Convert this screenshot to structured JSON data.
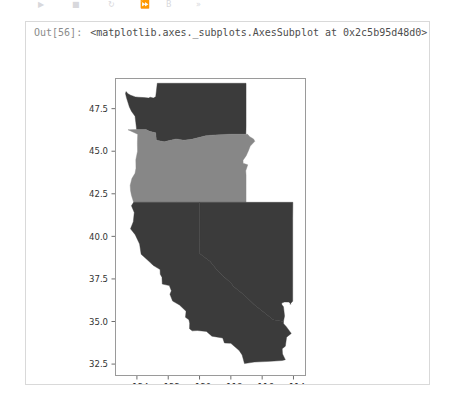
{
  "toolbar": {
    "items": [
      {
        "name": "run-icon",
        "glyph": "▶"
      },
      {
        "name": "stop-icon",
        "glyph": "■"
      },
      {
        "name": "restart-icon",
        "glyph": "↻"
      },
      {
        "name": "fastforward-icon",
        "glyph": "⏩"
      },
      {
        "name": "save-icon",
        "glyph": "὚B"
      },
      {
        "name": "more-icon",
        "glyph": "»"
      }
    ]
  },
  "output": {
    "prompt": "Out[56]:",
    "repr": "<matplotlib.axes._subplots.AxesSubplot at 0x2c5b95d48d0>"
  },
  "chart_data": {
    "type": "map",
    "title": "",
    "xlabel": "",
    "ylabel": "",
    "xlim": [
      -125.4,
      -113.2
    ],
    "ylim": [
      31.8,
      49.3
    ],
    "grid": false,
    "legend": null,
    "xticks": [
      -124,
      -122,
      -120,
      -118,
      -116,
      -114
    ],
    "xticklabels": [
      "−124",
      "−122",
      "−120",
      "−118",
      "−116",
      "−114"
    ],
    "yticks": [
      32.5,
      35.0,
      37.5,
      40.0,
      42.5,
      45.0,
      47.5
    ],
    "yticklabels": [
      "32.5",
      "35.0",
      "37.5",
      "40.0",
      "42.5",
      "45.0",
      "47.5"
    ],
    "colors": {
      "dark": "#3b3b3b",
      "mid": "#878787",
      "background": "#ffffff",
      "spine": "#9a9a9a"
    },
    "regions": [
      {
        "name": "Washington",
        "value": 1,
        "color": "#3b3b3b",
        "polygon": "-124.73,48.39 -124.69,48.50 -124.57,48.37 -124.40,48.29 -124.10,48.19 -123.90,48.17 -123.55,48.15 -123.25,48.12 -123.15,48.17 -122.95,48.12 -122.80,48.20 -122.76,48.50 -122.70,48.99 -117.03,48.99 -117.03,46.43 -117.04,46.00 -118.00,46.00 -119.00,45.96 -119.60,45.91 -120.50,45.70 -121.00,45.65 -121.50,45.72 -122.00,45.61 -122.25,45.55 -122.76,45.65 -122.80,46.08 -123.20,46.17 -123.42,46.27 -124.02,46.28 -124.07,46.68 -124.12,47.05 -124.35,47.35 -124.48,47.60 -124.67,48.15"
      },
      {
        "name": "Oregon",
        "value": 2,
        "color": "#878787",
        "polygon": "-124.57,46.26 -124.02,46.28 -123.42,46.27 -123.20,46.17 -122.80,46.08 -122.76,45.65 -122.25,45.55 -122.00,45.61 -121.50,45.72 -121.00,45.65 -120.50,45.70 -119.60,45.91 -119.00,45.96 -118.00,46.00 -117.04,46.00 -116.93,45.99 -116.79,45.85 -116.55,45.72 -116.47,45.58 -116.76,45.30 -116.89,45.00 -117.02,44.74 -117.22,44.47 -117.22,44.30 -116.92,44.20 -117.05,43.85 -117.03,43.60 -117.03,42.00 -120.00,42.00 -121.45,42.00 -122.50,42.00 -124.21,42.00 -124.35,42.42 -124.41,42.70 -124.43,43.00 -124.32,43.40 -124.12,43.70 -124.06,44.00 -124.07,44.50 -123.96,45.00 -123.97,45.50 -123.95,46.00"
      },
      {
        "name": "California",
        "value": 1,
        "color": "#3b3b3b",
        "polygon": "-124.21,42.00 -122.50,42.00 -121.45,42.00 -120.00,42.00 -120.00,41.00 -120.00,39.80 -119.99,39.00 -119.60,38.71 -119.32,38.53 -118.95,38.10 -118.43,37.62 -118.00,37.28 -117.83,37.06 -117.17,36.57 -116.52,36.00 -115.85,35.52 -115.30,35.10 -114.64,35.00 -114.63,34.87 -114.47,34.71 -114.14,34.30 -114.44,34.08 -114.52,33.55 -114.72,33.40 -114.70,33.09 -114.52,32.76 -114.72,32.71 -115.50,32.66 -116.50,32.62 -117.13,32.53 -117.28,33.04 -117.47,33.30 -118.00,33.72 -118.41,33.74 -118.52,34.03 -119.21,34.14 -119.56,34.42 -120.14,34.47 -120.47,34.45 -120.64,34.58 -120.63,34.90 -120.68,35.10 -120.90,35.25 -120.86,35.60 -121.28,35.97 -121.72,36.20 -121.89,36.60 -121.80,36.80 -121.93,37.11 -122.38,37.20 -122.40,37.60 -122.51,37.78 -122.52,38.05 -122.97,38.30 -123.13,38.45 -123.73,38.95 -123.83,39.55 -124.11,40.10 -124.41,40.44 -124.23,40.86 -124.17,41.40 -124.35,41.80"
      },
      {
        "name": "Nevada",
        "value": 1,
        "color": "#3b3b3b",
        "polygon": "-120.00,42.00 -114.04,42.00 -114.05,41.00 -114.05,40.00 -114.05,39.00 -114.05,38.00 -114.05,37.00 -114.05,36.19 -114.23,36.02 -114.15,36.03 -114.31,36.14 -114.57,36.15 -114.75,36.09 -114.74,35.99 -114.64,35.87 -114.57,35.33 -114.64,35.00 -115.30,35.10 -115.85,35.52 -116.52,36.00 -117.17,36.57 -117.83,37.06 -118.00,37.28 -118.43,37.62 -118.95,38.10 -119.32,38.53 -119.60,38.71 -119.99,39.00 -120.00,39.80 -120.00,41.00"
      }
    ]
  }
}
